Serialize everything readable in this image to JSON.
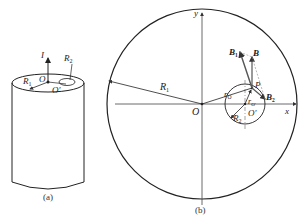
{
  "figure_a": {
    "caption": "(a)",
    "labels": {
      "current": "I",
      "big_radius": "R",
      "big_radius_sub": "1",
      "small_radius": "R",
      "small_radius_sub": "2",
      "center": "O",
      "hole_center": "O'"
    }
  },
  "figure_b": {
    "caption": "(b)",
    "labels": {
      "x_axis": "x",
      "y_axis": "y",
      "origin": "O",
      "hole_center": "O'",
      "big_radius": "R",
      "big_radius_sub": "1",
      "small_radius": "R",
      "small_radius_sub": "2",
      "offset": "r",
      "offset_sub": "O",
      "point": "P",
      "r_sub_label": "r",
      "r_sub_label_sub": "O'",
      "field_total": "B",
      "field_1": "B",
      "field_1_sub": "1",
      "field_2": "B",
      "field_2_sub": "2"
    }
  },
  "colors": {
    "line": "#222222",
    "axis": "#444444",
    "helper": "#888888"
  }
}
